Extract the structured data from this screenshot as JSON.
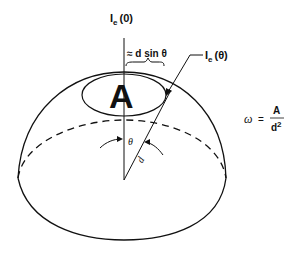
{
  "diagram": {
    "type": "solid-angle-hemisphere",
    "labels": {
      "ie0_main": "I",
      "ie0_sub": "e",
      "ie0_arg": "(0)",
      "ietheta_main": "I",
      "ietheta_sub": "e",
      "ietheta_arg": "(θ)",
      "approx": "≈ d sin θ",
      "area_letter": "A",
      "theta": "θ",
      "distance": "d",
      "formula_lhs": "ω",
      "formula_eq": "=",
      "formula_num": "A",
      "formula_den_base": "d",
      "formula_den_exp": "2"
    },
    "colors": {
      "stroke": "#111111",
      "background": "#ffffff"
    }
  }
}
